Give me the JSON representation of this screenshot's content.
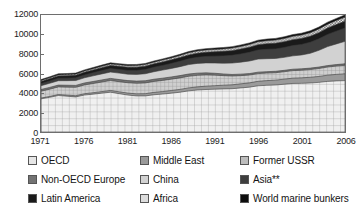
{
  "chart_data": {
    "type": "area",
    "title": "",
    "subtitle": "",
    "xlabel": "",
    "ylabel": "",
    "stacked": true,
    "grid": false,
    "legend_position": "bottom",
    "xlim": [
      1971,
      2006
    ],
    "ylim": [
      0,
      12000
    ],
    "yticks": [
      12000,
      10000,
      8000,
      6000,
      4000,
      2000,
      0
    ],
    "ytick_labels": [
      "12000",
      "10000",
      "8000",
      "6000",
      "4000",
      "2000",
      "0"
    ],
    "xticks": [
      1971,
      1976,
      1981,
      1986,
      1991,
      1996,
      2001,
      2006
    ],
    "xtick_labels": [
      "1971",
      "1976",
      "1981",
      "1986",
      "1991",
      "1996",
      "2001",
      "2006"
    ],
    "x": [
      1971,
      1972,
      1973,
      1974,
      1975,
      1976,
      1977,
      1978,
      1979,
      1980,
      1981,
      1982,
      1983,
      1984,
      1985,
      1986,
      1987,
      1988,
      1989,
      1990,
      1991,
      1992,
      1993,
      1994,
      1995,
      1996,
      1997,
      1998,
      1999,
      2000,
      2001,
      2002,
      2003,
      2004,
      2005,
      2006
    ],
    "series": [
      {
        "name": "OECD",
        "pattern": "grid",
        "color": "#e6e6e6",
        "values": [
          3400,
          3560,
          3740,
          3670,
          3600,
          3790,
          3880,
          3980,
          4080,
          3930,
          3790,
          3700,
          3700,
          3820,
          3890,
          3980,
          4080,
          4220,
          4310,
          4360,
          4390,
          4420,
          4440,
          4520,
          4600,
          4740,
          4790,
          4820,
          4900,
          4980,
          4990,
          5030,
          5090,
          5190,
          5240,
          5270
        ]
      },
      {
        "name": "Middle East",
        "pattern": "solid",
        "color": "#9a9a9a",
        "values": [
          80,
          90,
          100,
          110,
          120,
          135,
          150,
          165,
          180,
          190,
          200,
          215,
          230,
          245,
          260,
          275,
          290,
          305,
          320,
          340,
          360,
          380,
          400,
          420,
          440,
          460,
          480,
          500,
          520,
          545,
          565,
          585,
          610,
          640,
          670,
          700
        ]
      },
      {
        "name": "Former USSR",
        "pattern": "crosshatch",
        "color": "#bdbdbd",
        "values": [
          700,
          740,
          780,
          820,
          860,
          900,
          940,
          980,
          1020,
          1040,
          1060,
          1080,
          1100,
          1120,
          1140,
          1160,
          1180,
          1190,
          1180,
          1150,
          1080,
          980,
          900,
          840,
          800,
          790,
          770,
          760,
          760,
          770,
          780,
          790,
          810,
          830,
          850,
          870
        ]
      },
      {
        "name": "Non-OECD Europe",
        "pattern": "solid",
        "color": "#737373",
        "values": [
          180,
          185,
          190,
          195,
          200,
          205,
          210,
          215,
          218,
          220,
          222,
          224,
          226,
          228,
          230,
          232,
          234,
          232,
          228,
          215,
          195,
          175,
          160,
          155,
          152,
          150,
          148,
          146,
          145,
          145,
          146,
          148,
          150,
          152,
          154,
          156
        ]
      },
      {
        "name": "China",
        "pattern": "solid",
        "color": "#d2d2d2",
        "values": [
          390,
          420,
          450,
          470,
          500,
          530,
          580,
          620,
          650,
          660,
          660,
          690,
          720,
          770,
          830,
          870,
          920,
          970,
          1000,
          1020,
          1050,
          1100,
          1170,
          1230,
          1290,
          1340,
          1330,
          1320,
          1330,
          1370,
          1420,
          1520,
          1720,
          1950,
          2120,
          2300
        ]
      },
      {
        "name": "Asia**",
        "pattern": "solid",
        "color": "#3e3e3e",
        "values": [
          220,
          235,
          250,
          260,
          275,
          295,
          315,
          335,
          355,
          370,
          385,
          405,
          430,
          455,
          480,
          510,
          545,
          585,
          625,
          665,
          705,
          750,
          795,
          840,
          890,
          935,
          965,
          975,
          1010,
          1050,
          1080,
          1130,
          1180,
          1250,
          1310,
          1370
        ]
      },
      {
        "name": "Latin America",
        "pattern": "solid",
        "color": "#1a1a1a",
        "values": [
          210,
          225,
          240,
          250,
          260,
          275,
          290,
          305,
          320,
          325,
          330,
          335,
          340,
          350,
          360,
          375,
          390,
          405,
          420,
          430,
          445,
          465,
          480,
          500,
          520,
          545,
          570,
          585,
          595,
          610,
          615,
          620,
          630,
          655,
          680,
          700
        ]
      },
      {
        "name": "Africa",
        "pattern": "stipple",
        "color": "#dcdcdc",
        "values": [
          95,
          100,
          108,
          112,
          118,
          125,
          132,
          140,
          148,
          152,
          158,
          164,
          170,
          178,
          186,
          194,
          202,
          212,
          222,
          232,
          242,
          252,
          262,
          272,
          284,
          296,
          308,
          318,
          328,
          340,
          350,
          362,
          376,
          392,
          408,
          424
        ]
      },
      {
        "name": "World marine bunkers",
        "pattern": "solid",
        "color": "#0d0d0d",
        "values": [
          105,
          110,
          115,
          112,
          110,
          115,
          118,
          120,
          122,
          118,
          115,
          112,
          112,
          115,
          118,
          122,
          126,
          130,
          134,
          138,
          140,
          144,
          148,
          152,
          158,
          164,
          170,
          174,
          178,
          184,
          188,
          194,
          200,
          208,
          216,
          224
        ]
      }
    ],
    "legend": [
      [
        "OECD",
        "Middle East",
        "Former USSR"
      ],
      [
        "Non-OECD Europe",
        "China",
        "Asia**"
      ],
      [
        "Latin America",
        "Africa",
        "World marine bunkers"
      ]
    ]
  },
  "legend": {
    "r0c0": "OECD",
    "r0c1": "Middle East",
    "r0c2": "Former USSR",
    "r1c0": "Non-OECD Europe",
    "r1c1": "China",
    "r1c2": "Asia**",
    "r2c0": "Latin America",
    "r2c1": "Africa",
    "r2c2": "World marine bunkers"
  }
}
